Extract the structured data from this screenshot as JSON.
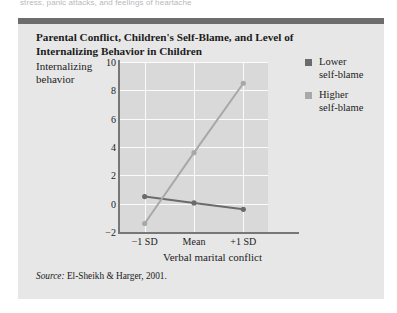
{
  "page": {
    "cutoff_text": "stress, panic attacks, and feelings of heartache"
  },
  "figure": {
    "title": "Parental Conflict, Children's Self-Blame, and Level of Internalizing Behavior in Children",
    "source_word": "Source:",
    "source_text": "El-Sheikh & Harger, 2001.",
    "top_rule_color": "#6d6d6d",
    "panel_bg": "#e7e7e7"
  },
  "chart_data": {
    "type": "line",
    "title": "Parental Conflict, Children's Self-Blame, and Level of Internalizing Behavior in Children",
    "xlabel": "Verbal marital conflict",
    "ylabel": "Internalizing behavior",
    "categories": [
      "-1 SD",
      "Mean",
      "+1 SD"
    ],
    "tick_labels_x": [
      "−1 SD",
      "Mean",
      "+1 SD"
    ],
    "ylim": [
      -2,
      10
    ],
    "yticks": [
      -2,
      0,
      2,
      4,
      6,
      8,
      10
    ],
    "ytick_labels": [
      "−2",
      "0",
      "2",
      "4",
      "6",
      "8",
      "10"
    ],
    "grid": true,
    "legend_position": "right",
    "plot_bg": "#d9d9d9",
    "gridline_color": "#fbfbfb",
    "series": [
      {
        "name": "Lower self-blame",
        "color": "#6b6b6b",
        "marker": "circle",
        "values": [
          0.5,
          0.05,
          -0.4
        ]
      },
      {
        "name": "Higher self-blame",
        "color": "#a8a8a8",
        "marker": "circle",
        "values": [
          -1.4,
          3.6,
          8.5
        ]
      }
    ]
  },
  "legend": {
    "entries": [
      {
        "label_line1": "Lower",
        "label_line2": "self-blame",
        "color": "#6b6b6b"
      },
      {
        "label_line1": "Higher",
        "label_line2": "self-blame",
        "color": "#a8a8a8"
      }
    ]
  }
}
